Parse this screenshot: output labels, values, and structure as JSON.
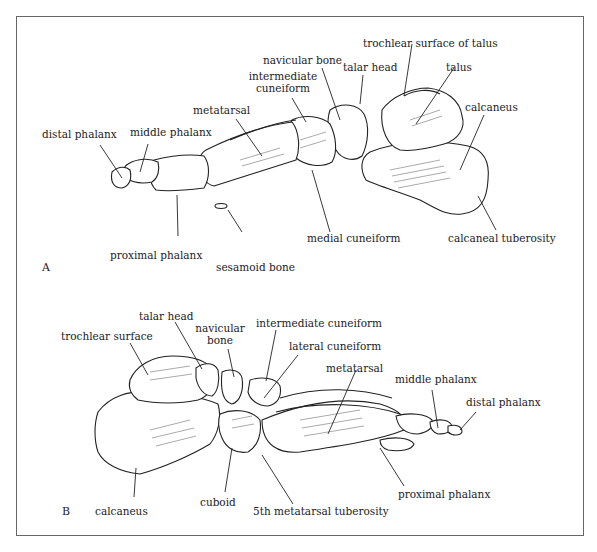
{
  "figure": {
    "panels": [
      {
        "id": "A",
        "letter": "A",
        "view": "medial view of foot skeleton",
        "labels": {
          "distal_phalanx": "distal phalanx",
          "middle_phalanx": "middle phalanx",
          "metatarsal": "metatarsal",
          "intermediate_cuneiform_1": "intermediate",
          "intermediate_cuneiform_2": "cuneiform",
          "navicular_bone": "navicular bone",
          "talar_head": "talar head",
          "trochlear_surface_of_talus": "trochlear surface of talus",
          "talus": "talus",
          "calcaneus": "calcaneus",
          "proximal_phalanx": "proximal phalanx",
          "sesamoid_bone": "sesamoid bone",
          "medial_cuneiform": "medial cuneiform",
          "calcaneal_tuberosity": "calcaneal tuberosity"
        }
      },
      {
        "id": "B",
        "letter": "B",
        "view": "lateral view of foot skeleton",
        "labels": {
          "trochlear_surface": "trochlear surface",
          "talar_head": "talar head",
          "navicular_bone_1": "navicular",
          "navicular_bone_2": "bone",
          "intermediate_cuneiform": "intermediate cuneiform",
          "lateral_cuneiform": "lateral cuneiform",
          "metatarsal": "metatarsal",
          "middle_phalanx": "middle phalanx",
          "distal_phalanx": "distal phalanx",
          "calcaneus": "calcaneus",
          "cuboid": "cuboid",
          "fifth_metatarsal_tuberosity": "5th metatarsal tuberosity",
          "proximal_phalanx": "proximal phalanx"
        }
      }
    ],
    "colors": {
      "ink": "#1a1a1a",
      "frame": "#666666",
      "background": "#ffffff"
    }
  }
}
